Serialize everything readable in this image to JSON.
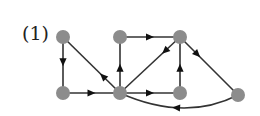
{
  "figure": {
    "label": "(1)",
    "node_color": "#8c8c8c",
    "edge_color": "#333333",
    "node_radius": 7
  },
  "nodes": [
    {
      "id": "A",
      "x": 63,
      "y": 37
    },
    {
      "id": "B",
      "x": 63,
      "y": 93
    },
    {
      "id": "C",
      "x": 120,
      "y": 37
    },
    {
      "id": "D",
      "x": 180,
      "y": 37
    },
    {
      "id": "E",
      "x": 120,
      "y": 93
    },
    {
      "id": "F",
      "x": 180,
      "y": 93
    },
    {
      "id": "G",
      "x": 238,
      "y": 95
    }
  ],
  "edges": [
    {
      "from": "A",
      "to": "B",
      "arrow_pos": 0.45
    },
    {
      "from": "B",
      "to": "E",
      "arrow_pos": 0.5
    },
    {
      "from": "E",
      "to": "A",
      "arrow_pos": 0.3
    },
    {
      "from": "E",
      "to": "C",
      "arrow_pos": 0.45
    },
    {
      "from": "C",
      "to": "D",
      "arrow_pos": 0.5
    },
    {
      "from": "D",
      "to": "E",
      "arrow_pos": 0.25
    },
    {
      "from": "E",
      "to": "F",
      "arrow_pos": 0.5
    },
    {
      "from": "F",
      "to": "D",
      "arrow_pos": 0.45
    },
    {
      "from": "D",
      "to": "G",
      "arrow_pos": 0.3
    },
    {
      "from": "G",
      "to": "E",
      "arrow_pos": 0.55,
      "curve": {
        "cx": 185,
        "cy": 122
      }
    }
  ]
}
